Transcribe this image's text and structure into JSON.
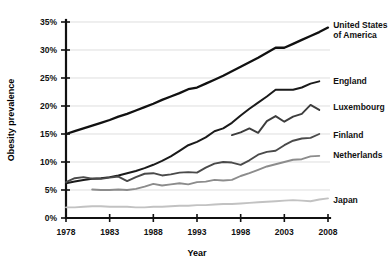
{
  "chart_data": {
    "type": "line",
    "title": "",
    "xlabel": "Year",
    "ylabel": "Obesity prevalence",
    "xlim": [
      1978,
      2008
    ],
    "ylim": [
      0,
      35
    ],
    "grid": true,
    "legend_position": "right-inline-labels",
    "x_ticks": [
      "1978",
      "1983",
      "1988",
      "1993",
      "1998",
      "2003",
      "2008"
    ],
    "x_tick_values": [
      1978,
      1983,
      1988,
      1993,
      1998,
      2003,
      2008
    ],
    "y_ticks": [
      "0%",
      "5%",
      "10%",
      "15%",
      "20%",
      "25%",
      "30%",
      "35%"
    ],
    "y_tick_values": [
      0,
      5,
      10,
      15,
      20,
      25,
      30,
      35
    ],
    "series": [
      {
        "name": "United States of America",
        "label": "United States of America",
        "color": "#111111",
        "width": 2.3,
        "label_x": 2008.6,
        "label_y": 34.4,
        "x": [
          1978,
          1979,
          1980,
          1981,
          1982,
          1983,
          1984,
          1985,
          1986,
          1987,
          1988,
          1989,
          1990,
          1991,
          1992,
          1993,
          1994,
          1995,
          1996,
          1997,
          1998,
          1999,
          2000,
          2001,
          2002,
          2003,
          2004,
          2005,
          2006,
          2007,
          2008
        ],
        "values": [
          15.0,
          15.5,
          16.0,
          16.5,
          17.0,
          17.5,
          18.1,
          18.6,
          19.2,
          19.8,
          20.4,
          21.1,
          21.7,
          22.3,
          23.0,
          23.3,
          24.0,
          24.7,
          25.4,
          26.2,
          27.0,
          27.8,
          28.6,
          29.5,
          30.4,
          30.4,
          31.1,
          31.8,
          32.5,
          33.2,
          34.0
        ]
      },
      {
        "name": "England",
        "label": "England",
        "color": "#1a1a1a",
        "width": 2.0,
        "label_x": 2008.6,
        "label_y": 24.4,
        "x": [
          1978,
          1979,
          1980,
          1981,
          1982,
          1983,
          1984,
          1985,
          1986,
          1987,
          1988,
          1989,
          1990,
          1991,
          1992,
          1993,
          1994,
          1995,
          1996,
          1997,
          1998,
          1999,
          2000,
          2001,
          2002,
          2003,
          2004,
          2005,
          2006,
          2007
        ],
        "values": [
          6.2,
          6.5,
          6.8,
          7.0,
          7.1,
          7.3,
          7.6,
          8.0,
          8.4,
          8.9,
          9.5,
          10.2,
          11.0,
          12.0,
          13.0,
          13.6,
          14.4,
          15.5,
          16.0,
          17.0,
          18.3,
          19.5,
          20.6,
          21.7,
          22.9,
          22.9,
          22.9,
          23.3,
          24.0,
          24.4
        ]
      },
      {
        "name": "Luxembourg",
        "label": "Luxembourg",
        "color": "#3d3d3d",
        "width": 1.9,
        "label_x": 2008.6,
        "label_y": 19.8,
        "x": [
          1997,
          1998,
          1999,
          2000,
          2001,
          2002,
          2003,
          2004,
          2005,
          2006,
          2007
        ],
        "values": [
          14.8,
          15.3,
          16.0,
          15.2,
          17.3,
          18.2,
          17.2,
          18.1,
          18.6,
          20.2,
          19.3
        ]
      },
      {
        "name": "Finland",
        "label": "Finland",
        "color": "#4a4a4a",
        "width": 1.9,
        "label_x": 2008.6,
        "label_y": 14.9,
        "x": [
          1978,
          1979,
          1980,
          1981,
          1982,
          1983,
          1984,
          1985,
          1986,
          1987,
          1988,
          1989,
          1990,
          1991,
          1992,
          1993,
          1994,
          1995,
          1996,
          1997,
          1998,
          1999,
          2000,
          2001,
          2002,
          2003,
          2004,
          2005,
          2006,
          2007
        ],
        "values": [
          6.4,
          7.1,
          7.3,
          7.0,
          7.0,
          7.2,
          7.4,
          6.6,
          7.3,
          7.9,
          8.0,
          7.6,
          7.8,
          8.1,
          8.2,
          8.1,
          9.0,
          9.7,
          10.0,
          9.9,
          9.5,
          10.3,
          11.3,
          11.8,
          12.0,
          13.0,
          13.8,
          14.2,
          14.3,
          15.0
        ]
      },
      {
        "name": "Netherlands",
        "label": "Netherlands",
        "color": "#8c8c8c",
        "width": 1.9,
        "label_x": 2008.6,
        "label_y": 11.2,
        "x": [
          1981,
          1982,
          1983,
          1984,
          1985,
          1986,
          1987,
          1988,
          1989,
          1990,
          1991,
          1992,
          1993,
          1994,
          1995,
          1996,
          1997,
          1998,
          1999,
          2000,
          2001,
          2002,
          2003,
          2004,
          2005,
          2006,
          2007
        ],
        "values": [
          5.1,
          5.0,
          5.0,
          5.1,
          5.0,
          5.2,
          5.6,
          6.1,
          5.8,
          6.0,
          6.2,
          6.0,
          6.4,
          6.5,
          6.8,
          6.7,
          6.8,
          7.5,
          8.0,
          8.6,
          9.2,
          9.6,
          10.0,
          10.4,
          10.5,
          11.0,
          11.1
        ]
      },
      {
        "name": "Japan",
        "label": "Japan",
        "color": "#c2c2c2",
        "width": 1.9,
        "label_x": 2008.6,
        "label_y": 3.2,
        "x": [
          1978,
          1979,
          1980,
          1981,
          1982,
          1983,
          1984,
          1985,
          1986,
          1987,
          1988,
          1989,
          1990,
          1991,
          1992,
          1993,
          1994,
          1995,
          1996,
          1997,
          1998,
          1999,
          2000,
          2001,
          2002,
          2003,
          2004,
          2005,
          2006,
          2007,
          2008
        ],
        "values": [
          1.9,
          1.9,
          2.0,
          2.1,
          2.1,
          2.0,
          2.0,
          2.0,
          1.9,
          1.9,
          2.0,
          2.0,
          2.1,
          2.2,
          2.2,
          2.3,
          2.3,
          2.4,
          2.5,
          2.5,
          2.6,
          2.7,
          2.8,
          2.9,
          3.0,
          3.1,
          3.2,
          3.1,
          3.0,
          3.3,
          3.5
        ]
      }
    ]
  }
}
